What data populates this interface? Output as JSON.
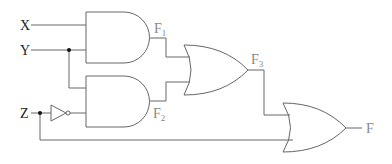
{
  "diagram": {
    "type": "logic-circuit",
    "inputs": [
      {
        "id": "x",
        "label": "X"
      },
      {
        "id": "y",
        "label": "Y"
      },
      {
        "id": "z",
        "label": "Z"
      }
    ],
    "gates": [
      {
        "id": "and1",
        "type": "AND",
        "inputs": [
          "X",
          "Y"
        ],
        "output": "F1"
      },
      {
        "id": "and2",
        "type": "AND",
        "inputs": [
          "Y",
          "NOT Z"
        ],
        "output": "F2"
      },
      {
        "id": "not1",
        "type": "NOT",
        "inputs": [
          "Z"
        ],
        "output": "Z'"
      },
      {
        "id": "or1",
        "type": "OR",
        "inputs": [
          "F1",
          "F2"
        ],
        "output": "F3"
      },
      {
        "id": "or2",
        "type": "OR",
        "inputs": [
          "F3",
          "Z"
        ],
        "output": "F"
      }
    ],
    "labels": {
      "x": "X",
      "y": "Y",
      "z": "Z",
      "f1_main": "F",
      "f1_sub": "1",
      "f2_main": "F",
      "f2_sub": "2",
      "f3_main": "F",
      "f3_sub": "3",
      "f": "F"
    },
    "colors": {
      "wire": "#666666",
      "junction": "#111111",
      "input_label": "#222222",
      "output_label": "#888888"
    }
  }
}
